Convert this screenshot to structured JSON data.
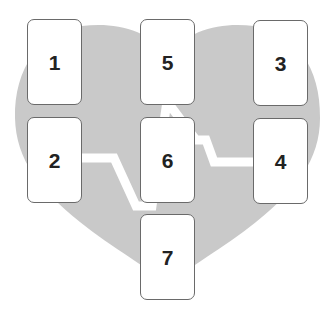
{
  "diagram": {
    "type": "tarot-card-spread",
    "background_shape": "heart",
    "background_motif": "heartbeat-line",
    "colors": {
      "background": "#ffffff",
      "heart_fill": "#c9c9c9",
      "heartbeat_line": "#ffffff",
      "card_fill": "#ffffff",
      "card_border": "#6a6a6a",
      "label": "#222222"
    },
    "cards": [
      {
        "id": "card-1",
        "label": "1",
        "x": 27,
        "y": 19
      },
      {
        "id": "card-5",
        "label": "5",
        "x": 140,
        "y": 19
      },
      {
        "id": "card-3",
        "label": "3",
        "x": 253,
        "y": 20
      },
      {
        "id": "card-2",
        "label": "2",
        "x": 27,
        "y": 117
      },
      {
        "id": "card-6",
        "label": "6",
        "x": 140,
        "y": 117
      },
      {
        "id": "card-4",
        "label": "4",
        "x": 253,
        "y": 118
      },
      {
        "id": "card-7",
        "label": "7",
        "x": 140,
        "y": 214
      }
    ]
  }
}
